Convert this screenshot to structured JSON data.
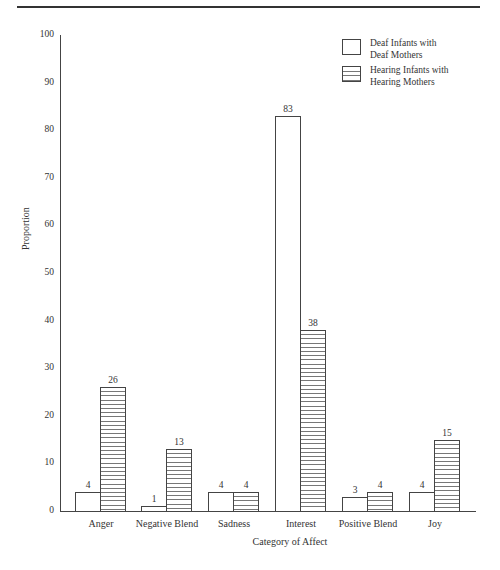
{
  "chart_data": {
    "type": "bar",
    "title": "",
    "xlabel": "Category of Affect",
    "ylabel": "Proportion",
    "ylim": [
      0,
      100
    ],
    "yticks": [
      0,
      10,
      20,
      30,
      40,
      50,
      60,
      70,
      80,
      90,
      100
    ],
    "grid": false,
    "legend_position": "top-right",
    "categories": [
      "Anger",
      "Negative Blend",
      "Sadness",
      "Interest",
      "Positive Blend",
      "Joy"
    ],
    "series": [
      {
        "name": "Deaf Infants with Deaf Mothers",
        "pattern": "plain",
        "values": [
          4,
          1,
          4,
          83,
          3,
          4
        ]
      },
      {
        "name": "Hearing Infants with Hearing Mothers",
        "pattern": "horizontal-hatch",
        "values": [
          26,
          13,
          4,
          38,
          4,
          15
        ]
      }
    ]
  },
  "labels": {
    "ylabel": "Proportion",
    "xlabel": "Category of Affect",
    "yticks": [
      "0",
      "10",
      "20",
      "30",
      "40",
      "50",
      "60",
      "70",
      "80",
      "90",
      "100"
    ],
    "categories": [
      "Anger",
      "Negative Blend",
      "Sadness",
      "Interest",
      "Positive Blend",
      "Joy"
    ],
    "legend": {
      "deaf_line1": "Deaf Infants with",
      "deaf_line2": "Deaf Mothers",
      "hearing_line1": "Hearing Infants with",
      "hearing_line2": "Hearing Mothers"
    },
    "values": {
      "deaf": [
        "4",
        "1",
        "4",
        "83",
        "3",
        "4"
      ],
      "hearing": [
        "26",
        "13",
        "4",
        "38",
        "4",
        "15"
      ]
    }
  },
  "colors": {
    "axis": "#444444",
    "bar_fill": "#ffffff",
    "hatch": "#777777",
    "text": "#333333"
  }
}
